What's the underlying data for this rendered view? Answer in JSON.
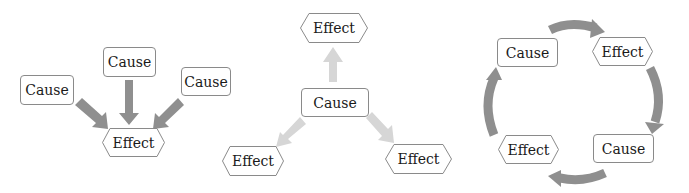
{
  "diagrams": [
    {
      "name": "many-causes-one-effect",
      "causes": [
        "Cause",
        "Cause",
        "Cause"
      ],
      "effect": "Effect",
      "arrow_color": "#8f8f8f"
    },
    {
      "name": "one-cause-many-effects",
      "cause": "Cause",
      "effects": [
        "Effect",
        "Effect",
        "Effect"
      ],
      "arrow_color": "#d4d4d4"
    },
    {
      "name": "cause-effect-cycle",
      "nodes": [
        "Cause",
        "Effect",
        "Cause",
        "Effect"
      ],
      "arrow_color": "#8f8f8f"
    }
  ]
}
